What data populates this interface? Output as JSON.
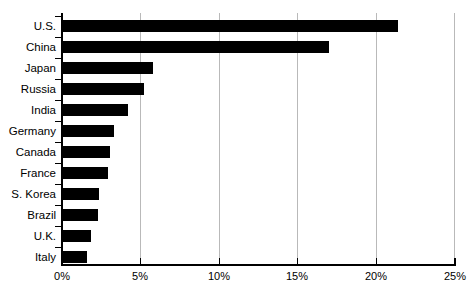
{
  "chart_data": {
    "type": "bar",
    "orientation": "horizontal",
    "title": "",
    "subtitle": "",
    "xlabel": "",
    "ylabel": "",
    "xlim": [
      0,
      25
    ],
    "xticks": [
      0,
      5,
      10,
      15,
      20,
      25
    ],
    "xtick_labels": [
      "0%",
      "5%",
      "10%",
      "15%",
      "20%",
      "25%"
    ],
    "grid": "vertical",
    "legend": "none",
    "bar_color": "#000000",
    "gridline_color": "#b9b9b9",
    "axis_color": "#000000",
    "categories": [
      "U.S.",
      "China",
      "Japan",
      "Russia",
      "India",
      "Germany",
      "Canada",
      "France",
      "S. Korea",
      "Brazil",
      "U.K.",
      "Italy"
    ],
    "values": [
      21.4,
      17.0,
      5.8,
      5.2,
      4.2,
      3.3,
      3.05,
      2.9,
      2.35,
      2.3,
      1.85,
      1.6
    ]
  }
}
